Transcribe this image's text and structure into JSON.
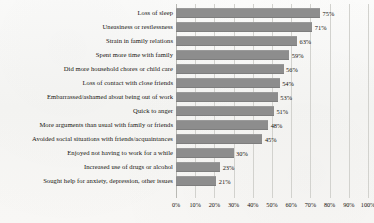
{
  "chart_data": {
    "type": "bar",
    "orientation": "horizontal",
    "title": "",
    "subtitle": "",
    "xlabel": "",
    "ylabel": "",
    "xlim": [
      0,
      100
    ],
    "grid": true,
    "legend": false,
    "value_suffix": "%",
    "categories": [
      "Loss of sleep",
      "Uneasiness or restlessness",
      "Strain in family relations",
      "Spent more time with family",
      "Did more household chores or child care",
      "Loss of contact with close friends",
      "Embarrassed/ashamed about being out of work",
      "Quick to anger",
      "More arguments than usual with family or friends",
      "Avoided social situations with friends/acquaintances",
      "Enjoyed not having to work for a while",
      "Increased use of drugs or alcohol",
      "Sought help for anxiety, depression, other issues"
    ],
    "values": [
      75,
      71,
      63,
      59,
      56,
      54,
      53,
      51,
      48,
      45,
      30,
      23,
      21
    ],
    "value_labels": [
      "75%",
      "71%",
      "63%",
      "59%",
      "56%",
      "54%",
      "53%",
      "51%",
      "48%",
      "45%",
      "30%",
      "23%",
      "21%"
    ],
    "xticks": [
      0,
      10,
      20,
      30,
      40,
      50,
      60,
      70,
      80,
      90,
      100
    ],
    "xtick_labels": [
      "0%",
      "10%",
      "20%",
      "30%",
      "40%",
      "50%",
      "60%",
      "70%",
      "80%",
      "90%",
      "100%"
    ],
    "colors": {
      "bar": "#8d8d8d",
      "background": "#f7f7f5",
      "gridline": "#d2d2ce",
      "text": "#15130f"
    }
  }
}
